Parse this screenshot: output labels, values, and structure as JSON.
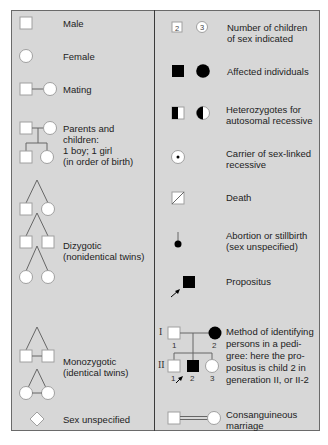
{
  "legend": {
    "left_column": [
      {
        "id": "male",
        "label": "Male",
        "symbol": "square"
      },
      {
        "id": "female",
        "label": "Female",
        "symbol": "circle"
      },
      {
        "id": "mating",
        "label": "Mating",
        "symbol": "square-line-circle"
      },
      {
        "id": "parents_children",
        "label": "Parents and\nchildren:\n1 boy; 1 girl\n(in order of birth)",
        "symbol": "family-tree"
      },
      {
        "id": "dizygotic",
        "label": "Dizygotic\n(nonidentical twins)",
        "symbol": "twins-separate-branches"
      },
      {
        "id": "monozygotic",
        "label": "Monozygotic\n(identical twins)",
        "symbol": "twins-with-crossbar"
      },
      {
        "id": "sex_unspecified",
        "label": "Sex unspecified",
        "symbol": "diamond"
      }
    ],
    "right_column": [
      {
        "id": "number_children",
        "label": "Number of children\nof sex indicated",
        "symbol": "numbered-square-circle",
        "numbers": [
          "2",
          "3"
        ]
      },
      {
        "id": "affected",
        "label": "Affected individuals",
        "symbol": "filled-square-circle"
      },
      {
        "id": "heterozygotes",
        "label": "Heterozygotes for\nautosomal recessive",
        "symbol": "half-filled-square-circle"
      },
      {
        "id": "carrier_sex_linked",
        "label": "Carrier of sex-linked\nrecessive",
        "symbol": "circle-with-dot"
      },
      {
        "id": "death",
        "label": "Death",
        "symbol": "square-with-slash"
      },
      {
        "id": "abortion",
        "label": "Abortion or stillbirth\n(sex unspecified)",
        "symbol": "small-filled-circle-with-stem"
      },
      {
        "id": "propositus",
        "label": "Propositus",
        "symbol": "filled-square-with-arrow"
      },
      {
        "id": "pedigree_method",
        "label": "Method of identifying\npersons in a pedi-\ngree: here the pro-\npositus is child 2 in\ngeneration II, or II-2",
        "symbol": "pedigree-example",
        "generations": [
          "I",
          "II"
        ],
        "gen1_numbers": [
          "1",
          "2"
        ],
        "gen2_numbers": [
          "1",
          "2",
          "3"
        ]
      },
      {
        "id": "consanguineous",
        "label": "Consanguineous\nmarriage",
        "symbol": "double-line-mating"
      }
    ]
  },
  "colors": {
    "background": "#d7d7d7",
    "symbol_fill": "#ffffff",
    "symbol_stroke": "#9a9a9a",
    "affected_fill": "#000000",
    "line": "#555555"
  }
}
